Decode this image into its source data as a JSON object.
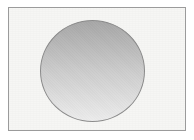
{
  "figure": {
    "kind": "shaded-circle-figure",
    "canvas": {
      "width": 194,
      "height": 140,
      "background_color": "#ffffff"
    },
    "frame": {
      "name": "plate-border",
      "x": 8,
      "y": 7,
      "width": 178,
      "height": 124,
      "border_color": "#9b9b9b",
      "border_width": 1,
      "fill_color": "#f6f6f4"
    },
    "circle": {
      "name": "shaded-circle",
      "center_x": 91,
      "center_y": 70,
      "width": 105,
      "height": 102,
      "stroke_color": "#8a8a8a",
      "stroke_width": 1,
      "shading": "vertical-gradient",
      "gradient_top_color": "#a6a6a6",
      "gradient_mid_color": "#cccccc",
      "gradient_bottom_color": "#ececec"
    },
    "texture": {
      "name": "paper-grain",
      "description": "scanned-paper speckle"
    },
    "labels": {
      "figure_caption": "",
      "axis_labels": [],
      "annotations": []
    }
  }
}
